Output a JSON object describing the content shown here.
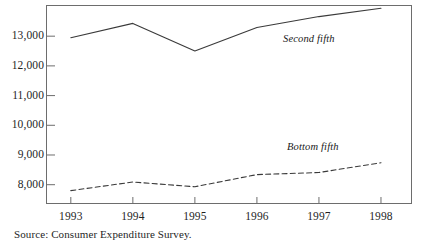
{
  "chart_data": {
    "type": "line",
    "title": "",
    "subtitle": "",
    "xlabel": "",
    "ylabel": "",
    "categories": [
      "1993",
      "1994",
      "1995",
      "1996",
      "1997",
      "1998"
    ],
    "x": [
      1993,
      1994,
      1995,
      1996,
      1997,
      1998
    ],
    "series": [
      {
        "name": "Second fifth",
        "style": "solid",
        "color": "#3a3a3a",
        "values": [
          12950,
          13430,
          12500,
          13290,
          13660,
          13940
        ]
      },
      {
        "name": "Bottom fifth",
        "style": "dashed",
        "color": "#3a3a3a",
        "values": [
          7800,
          8090,
          7930,
          8340,
          8410,
          8740
        ]
      }
    ],
    "ylim": [
      7350,
      14050
    ],
    "xlim": [
      1992.6,
      1998.5
    ],
    "yticks": [
      8000,
      9000,
      10000,
      11000,
      12000,
      13000
    ],
    "ytick_labels": [
      "8,000",
      "9,000",
      "10,000",
      "11,000",
      "12,000",
      "13,000"
    ],
    "xticks": [
      1993,
      1994,
      1995,
      1996,
      1997,
      1998
    ],
    "xtick_labels": [
      "1993",
      "1994",
      "1995",
      "1996",
      "1997",
      "1998"
    ],
    "grid": false,
    "legend": "inline-annotations",
    "annotations": [
      {
        "text": "Second fifth",
        "series": "Second fifth"
      },
      {
        "text": "Bottom fifth",
        "series": "Bottom fifth"
      }
    ]
  },
  "figure": {
    "source_note": "Source: Consumer Expenditure Survey.",
    "frame_color": "#6d6d6d"
  }
}
